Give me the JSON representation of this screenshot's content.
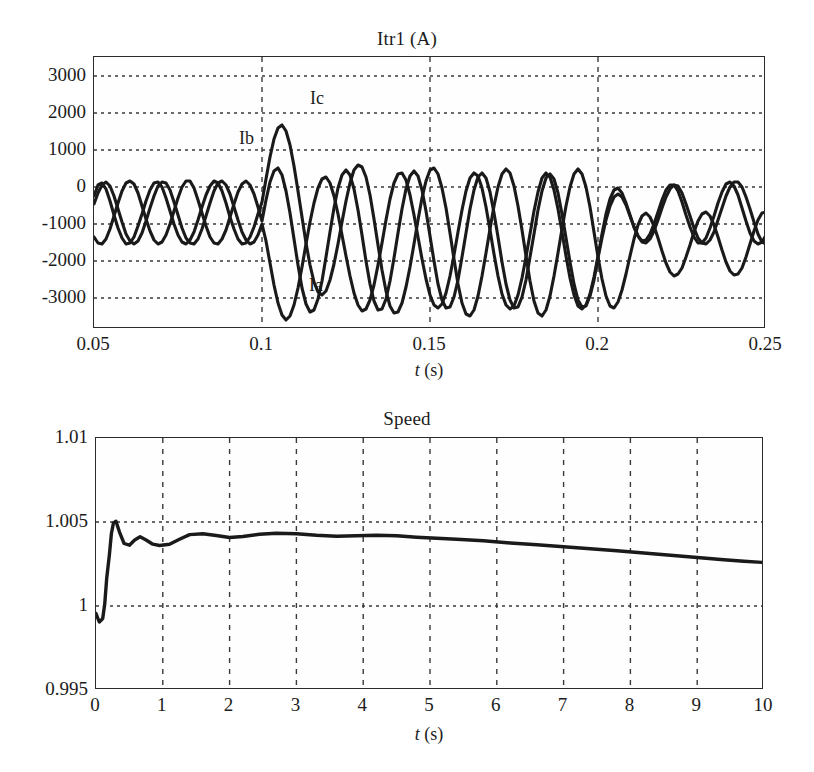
{
  "figure": {
    "background": "#ffffff",
    "line_color": "#1a1a1a",
    "grid_color": "#3a3a3a",
    "axis_color": "#2b2b2b"
  },
  "charts": [
    {
      "id": "current-chart",
      "chart_data": {
        "type": "line",
        "title": "Itr1 (A)",
        "xlabel": "t (s)",
        "ylabel": "",
        "xlim": [
          0.05,
          0.25
        ],
        "ylim": [
          -3500,
          3400
        ],
        "xticks": [
          0.05,
          0.1,
          0.15,
          0.2,
          0.25
        ],
        "xtick_labels": [
          "0.05",
          "0.1",
          "0.15",
          "0.2",
          "0.25"
        ],
        "yticks": [
          -3000,
          -2000,
          -1000,
          0,
          1000,
          2000,
          3000
        ],
        "ytick_labels": [
          "-3000",
          "-2000",
          "-1000",
          "0",
          "1000",
          "2000",
          "3000"
        ],
        "grid": true,
        "grid_style": "dotted",
        "legend": "inline-annotations",
        "annotations": [
          {
            "text": "Ic",
            "x": 0.1128,
            "y": 2560
          },
          {
            "text": "Ib",
            "x": 0.0955,
            "y": 1180
          },
          {
            "text": "Ia",
            "x": 0.1135,
            "y": -2780
          }
        ],
        "series": [
          {
            "name": "Ia",
            "phase_deg": 0,
            "steady_amplitude": 560,
            "fault_peak_amplitude": 3150,
            "fault_start": 0.1,
            "fault_end": 0.2,
            "frequency_hz": 50,
            "description": "Phase A transient short-circuit current"
          },
          {
            "name": "Ib",
            "phase_deg": -120,
            "steady_amplitude": 560,
            "fault_peak_amplitude": 3000,
            "fault_start": 0.1,
            "fault_end": 0.2,
            "frequency_hz": 50,
            "description": "Phase B transient short-circuit current"
          },
          {
            "name": "Ic",
            "phase_deg": 120,
            "steady_amplitude": 560,
            "fault_peak_amplitude": 3050,
            "fault_start": 0.1,
            "fault_end": 0.2,
            "frequency_hz": 50,
            "description": "Phase C transient short-circuit current"
          }
        ]
      }
    },
    {
      "id": "speed-chart",
      "chart_data": {
        "type": "line",
        "title": "Speed",
        "xlabel": "t (s)",
        "ylabel": "",
        "xlim": [
          0,
          10
        ],
        "ylim": [
          0.995,
          1.01
        ],
        "xticks": [
          0,
          1,
          2,
          3,
          4,
          5,
          6,
          7,
          8,
          9,
          10
        ],
        "xtick_labels": [
          "0",
          "1",
          "2",
          "3",
          "4",
          "5",
          "6",
          "7",
          "8",
          "9",
          "10"
        ],
        "yticks": [
          0.995,
          1,
          1.005,
          1.01
        ],
        "ytick_labels": [
          "0.995",
          "1",
          "1.005",
          "1.01"
        ],
        "grid": true,
        "grid_style": "dashed-vertical-dotted-horizontal",
        "series": [
          {
            "name": "Speed (pu)",
            "x": [
              0,
              0.05,
              0.1,
              0.13,
              0.16,
              0.2,
              0.23,
              0.26,
              0.3,
              0.35,
              0.42,
              0.5,
              0.58,
              0.66,
              0.75,
              0.85,
              0.95,
              1.1,
              1.25,
              1.4,
              1.6,
              1.8,
              2.0,
              2.2,
              2.45,
              2.7,
              3.0,
              3.3,
              3.6,
              3.9,
              4.2,
              4.5,
              4.8,
              5.1,
              5.4,
              5.8,
              6.2,
              6.6,
              7.0,
              7.4,
              7.8,
              8.2,
              8.6,
              9.0,
              9.4,
              9.7,
              10.0
            ],
            "y": [
              0.99955,
              0.99905,
              0.99925,
              1.0001,
              1.00165,
              1.00305,
              1.00432,
              1.00493,
              1.00505,
              1.00442,
              1.00372,
              1.00362,
              1.00393,
              1.00412,
              1.00393,
              1.00368,
              1.0036,
              1.00368,
              1.00398,
              1.00425,
              1.0043,
              1.0042,
              1.00408,
              1.00414,
              1.00428,
              1.00434,
              1.0043,
              1.00421,
              1.00415,
              1.00418,
              1.00422,
              1.00418,
              1.0041,
              1.00403,
              1.00397,
              1.00388,
              1.00375,
              1.00364,
              1.00352,
              1.0034,
              1.00328,
              1.00315,
              1.00302,
              1.00288,
              1.00275,
              1.00266,
              1.00258
            ]
          }
        ]
      }
    }
  ]
}
